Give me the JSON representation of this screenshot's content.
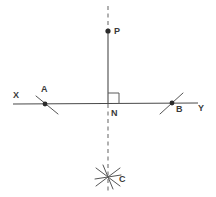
{
  "figure": {
    "background_color": "#ffffff",
    "line_color": "#4a4a4a",
    "dashed_color": "#6b6b6b",
    "arc_color": "#555555",
    "label_color": "#3a3a3a",
    "point_color": "#2b2b2b"
  },
  "labels": {
    "x_label": "X",
    "y_label": "Y",
    "a_label": "A",
    "b_label": "B",
    "n_label": "N",
    "p_label": "P",
    "c_label": "C"
  },
  "points": [
    {
      "name": "P",
      "label": "P",
      "x": 108,
      "y": 31,
      "marked": true
    },
    {
      "name": "A",
      "label": "A",
      "x": 45,
      "y": 104,
      "marked": true
    },
    {
      "name": "N",
      "label": "N",
      "x": 108,
      "y": 104,
      "marked": false
    },
    {
      "name": "B",
      "label": "B",
      "x": 172,
      "y": 103,
      "marked": true
    },
    {
      "name": "C",
      "label": "C",
      "x": 108,
      "y": 177,
      "marked": false
    }
  ],
  "segments": [
    {
      "name": "line-XY",
      "style": "solid",
      "x1": 13,
      "y1": 104,
      "x2": 198,
      "y2": 103
    },
    {
      "name": "segment-PN",
      "style": "solid",
      "x1": 108,
      "y1": 31,
      "x2": 108,
      "y2": 104
    },
    {
      "name": "ray-above-P",
      "style": "dashed",
      "x1": 108,
      "y1": 6,
      "x2": 108,
      "y2": 29
    },
    {
      "name": "ray-below-N",
      "style": "dashed",
      "x1": 108,
      "y1": 104,
      "x2": 108,
      "y2": 194
    }
  ],
  "right_angle": {
    "name": "right-angle-marker-at-N",
    "size": 11,
    "corner_x": 108,
    "corner_y": 104,
    "orientation": "upper-right"
  },
  "arcs": [
    {
      "name": "arc-through-A",
      "x1": 36,
      "y1": 96,
      "x2": 58,
      "y2": 114
    },
    {
      "name": "arc-through-B",
      "x1": 160,
      "y1": 114,
      "x2": 183,
      "y2": 93
    },
    {
      "name": "arc-at-C-1",
      "x1": 96,
      "y1": 168,
      "x2": 120,
      "y2": 186
    },
    {
      "name": "arc-at-C-2",
      "x1": 96,
      "y1": 186,
      "x2": 120,
      "y2": 168
    },
    {
      "name": "arc-at-C-3",
      "x1": 103,
      "y1": 165,
      "x2": 113,
      "y2": 189
    },
    {
      "name": "arc-at-C-4",
      "x1": 95,
      "y1": 179,
      "x2": 121,
      "y2": 175
    }
  ]
}
